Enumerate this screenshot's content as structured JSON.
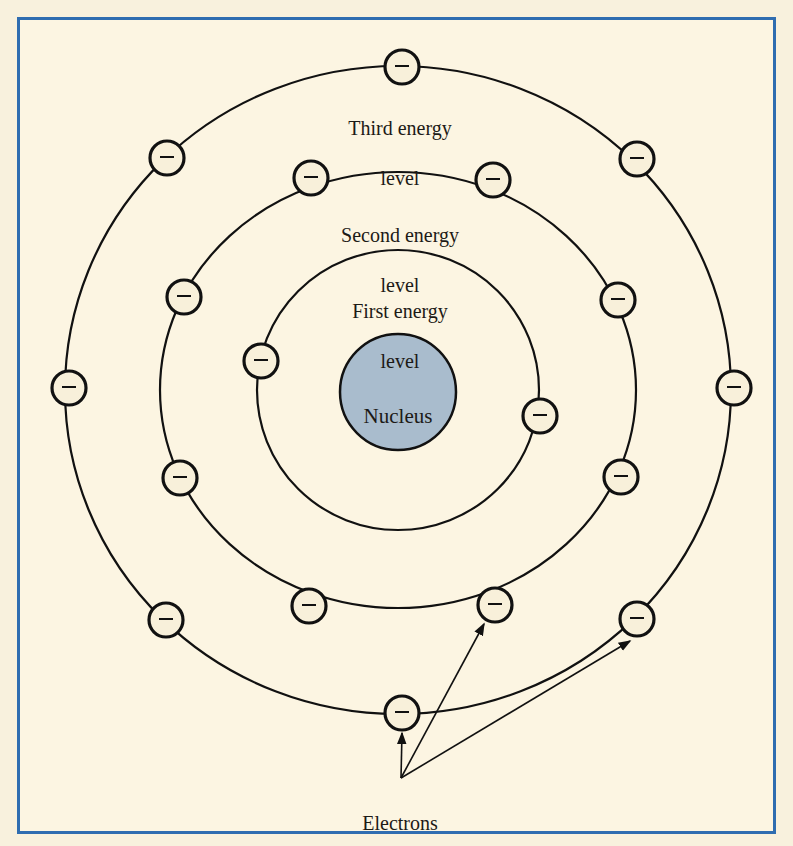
{
  "diagram": {
    "type": "bohr-atom-model",
    "colors": {
      "frame": "#2f6db0",
      "background": "#fcf5e2",
      "nucleus_fill": "#a9bccd",
      "line": "#111111",
      "electron_fill": "#f8f0da"
    },
    "nucleus": {
      "label": "Nucleus",
      "cx": 398,
      "cy": 392,
      "r": 58
    },
    "levels": [
      {
        "name": "first",
        "label_line1": "First energy",
        "label_line2": "level",
        "rx": 141,
        "ry": 140,
        "electrons": [
          [
            261,
            361
          ],
          [
            540,
            416
          ]
        ]
      },
      {
        "name": "second",
        "label_line1": "Second energy",
        "label_line2": "level",
        "rx": 238,
        "ry": 218,
        "electrons": [
          [
            311,
            178
          ],
          [
            493,
            180
          ],
          [
            184,
            297
          ],
          [
            618,
            300
          ],
          [
            180,
            478
          ],
          [
            621,
            477
          ],
          [
            309,
            606
          ],
          [
            495,
            605
          ]
        ]
      },
      {
        "name": "third",
        "label_line1": "Third energy",
        "label_line2": "level",
        "rx": 333,
        "ry": 324,
        "electrons": [
          [
            402,
            67
          ],
          [
            167,
            158
          ],
          [
            637,
            159
          ],
          [
            69,
            388
          ],
          [
            734,
            388
          ],
          [
            166,
            620
          ],
          [
            637,
            619
          ],
          [
            402,
            713
          ]
        ]
      }
    ],
    "electron_symbol": "−",
    "callout": {
      "label": "Electrons",
      "origin": [
        401,
        778
      ],
      "targets": [
        [
          402,
          733
        ],
        [
          484,
          624
        ],
        [
          630,
          641
        ]
      ]
    }
  }
}
